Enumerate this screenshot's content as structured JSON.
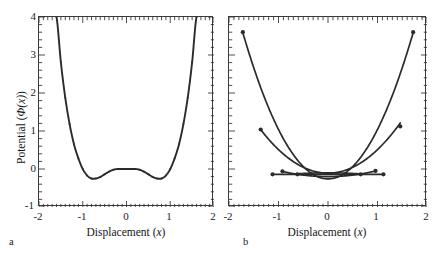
{
  "figure": {
    "panels": [
      {
        "letter": "a",
        "xlabel_prefix": "Displacement (",
        "xlabel_var": "x",
        "xlabel_suffix": ")",
        "ylabel_prefix": "Potential (",
        "ylabel_var": "Φ(x)",
        "ylabel_suffix": ")"
      },
      {
        "letter": "b",
        "xlabel_prefix": "Displacement (",
        "xlabel_var": "x",
        "xlabel_suffix": ")"
      }
    ],
    "ticks": {
      "y_labels": [
        "4",
        "3",
        "2",
        "1",
        "0",
        "-1"
      ],
      "x_labels_a": [
        "-2",
        "-1",
        "0",
        "1",
        "2"
      ],
      "x_labels_b": [
        "-2",
        "-1",
        "0",
        "1",
        "2"
      ]
    },
    "colors": {
      "curve": "#2b2b2b",
      "frame": "#3a3a3a",
      "background": "#ffffff",
      "text": "#1a1a1a"
    }
  },
  "chart_data": [
    {
      "type": "line",
      "panel": "a",
      "title": "",
      "xlabel": "Displacement (x)",
      "ylabel": "Potential (Φ(x))",
      "xlim": [
        -2,
        2
      ],
      "ylim": [
        -1,
        4
      ],
      "grid": false,
      "legend": null,
      "xticks": [
        -2,
        -1,
        0,
        1,
        2
      ],
      "yticks": [
        -1,
        0,
        1,
        2,
        3,
        4
      ],
      "minor_ticks": true,
      "description": "Symmetric double-well (quartic) potential with two minima near x = +/-0.78 at Φ = -0.25 and a local maximum at x = 0, Φ = 0.",
      "series": [
        {
          "name": "double-well potential",
          "marker": "point",
          "x": [
            -1.6,
            -1.5,
            -1.4,
            -1.3,
            -1.2,
            -1.1,
            -1.0,
            -0.9,
            -0.8,
            -0.7,
            -0.6,
            -0.5,
            -0.4,
            -0.3,
            -0.2,
            -0.1,
            0.0,
            0.1,
            0.2,
            0.3,
            0.4,
            0.5,
            0.6,
            0.7,
            0.8,
            0.9,
            1.0,
            1.1,
            1.2,
            1.3,
            1.4,
            1.5,
            1.6
          ],
          "y": [
            4.0,
            2.81,
            1.88,
            1.18,
            0.65,
            0.28,
            0.0,
            -0.17,
            -0.25,
            -0.25,
            -0.21,
            -0.14,
            -0.07,
            -0.02,
            0.0,
            0.0,
            0.0,
            0.0,
            0.0,
            -0.02,
            -0.07,
            -0.14,
            -0.21,
            -0.25,
            -0.25,
            -0.17,
            0.0,
            0.28,
            0.65,
            1.18,
            1.88,
            2.81,
            4.0
          ]
        }
      ]
    },
    {
      "type": "line",
      "panel": "b",
      "title": "",
      "xlabel": "Displacement (x)",
      "ylabel": "",
      "xlim": [
        -2,
        2
      ],
      "ylim": [
        -1,
        4
      ],
      "grid": false,
      "legend": null,
      "xticks": [
        -2,
        -1,
        0,
        1,
        2
      ],
      "yticks": [
        -1,
        0,
        1,
        2,
        3,
        4
      ],
      "minor_ticks": true,
      "description": "Family of harmonic (parabolic) approximations of varying curvature, each drawn over a finite displacement range terminated by filled circular endpoint markers. Curvature decreases from the steep outer parabola to a nearly flat segment, plus one inverted (concave-down) lens-shaped curve.",
      "series": [
        {
          "name": "parabola-steep",
          "marker": "filled-circle-endpoints",
          "curvature": 1.3,
          "vertex": [
            0.0,
            -0.26
          ],
          "x_range": [
            -1.72,
            1.72
          ],
          "endpoints": [
            [
              -1.72,
              3.6
            ],
            [
              1.72,
              3.6
            ]
          ]
        },
        {
          "name": "parabola-medium",
          "marker": "filled-circle-endpoints",
          "curvature": 0.62,
          "vertex": [
            0.0,
            -0.11
          ],
          "x_range": [
            -1.36,
            1.46
          ],
          "endpoints": [
            [
              -1.36,
              1.04
            ],
            [
              1.46,
              1.12
            ]
          ]
        },
        {
          "name": "parabola-shallow",
          "marker": "filled-circle-endpoints",
          "curvature": 0.16,
          "vertex": [
            0.0,
            -0.2
          ],
          "x_range": [
            -0.92,
            0.96
          ],
          "endpoints": [
            [
              -0.92,
              -0.06
            ],
            [
              0.96,
              -0.05
            ]
          ]
        },
        {
          "name": "flat-line",
          "marker": "filled-circle-endpoints",
          "curvature": 0.0,
          "vertex": [
            0.0,
            -0.14
          ],
          "x_range": [
            -1.12,
            1.12
          ],
          "endpoints": [
            [
              -1.12,
              -0.14
            ],
            [
              1.12,
              -0.14
            ]
          ]
        },
        {
          "name": "inverted-lens",
          "marker": "filled-circle-endpoints",
          "curvature": -0.07,
          "vertex": [
            0.0,
            -0.1
          ],
          "x_range": [
            -0.62,
            0.66
          ],
          "endpoints": [
            [
              -0.62,
              -0.14
            ],
            [
              0.66,
              -0.14
            ]
          ]
        }
      ]
    }
  ]
}
